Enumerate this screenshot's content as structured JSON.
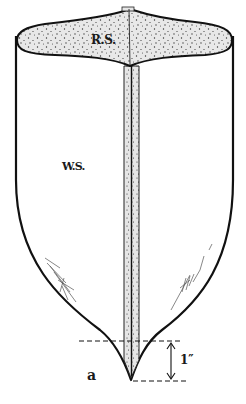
{
  "diagram": {
    "type": "botanical/anatomical line drawing",
    "labels": {
      "upper_region": "R.S.",
      "lower_region": "W.S.",
      "tip_point": "a",
      "measurement": "1″"
    },
    "colors": {
      "outline": "#111111",
      "stipple_fill": "#e6e6e6",
      "stipple_dots": "#333333",
      "background": "#ffffff"
    },
    "dimension": {
      "value_label": "1″",
      "from": "upper dashed line",
      "to": "tip a"
    }
  }
}
